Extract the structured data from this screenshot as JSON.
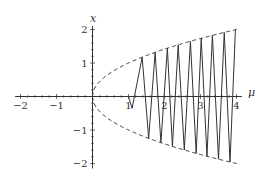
{
  "chart_data": {
    "type": "line",
    "title": "",
    "xlabel": "μ",
    "ylabel": "x",
    "xlim": [
      -2,
      4.15
    ],
    "ylim": [
      -2.15,
      2.2
    ],
    "grid": false,
    "legend": null,
    "x_ticks": [
      -2,
      -1,
      1,
      2,
      3,
      4
    ],
    "x_tick_labels": [
      "−2",
      "−1",
      "1",
      "2",
      "3",
      "4"
    ],
    "y_ticks": [
      -2,
      -1,
      1,
      2
    ],
    "y_tick_labels": [
      "−2",
      "−1",
      "1",
      "2"
    ],
    "series": [
      {
        "name": "upper envelope",
        "style": "dashed",
        "formula": "x = sqrt(μ)",
        "x": [
          0,
          0.25,
          0.5,
          1,
          1.5,
          2,
          2.5,
          3,
          3.5,
          4
        ],
        "values": [
          0,
          0.5,
          0.71,
          1,
          1.22,
          1.41,
          1.58,
          1.73,
          1.87,
          2
        ]
      },
      {
        "name": "lower envelope",
        "style": "dashed",
        "formula": "x = -sqrt(μ)",
        "x": [
          0,
          0.25,
          0.5,
          1,
          1.5,
          2,
          2.5,
          3,
          3.5,
          4
        ],
        "values": [
          0,
          -0.5,
          -0.71,
          -1,
          -1.22,
          -1.41,
          -1.58,
          -1.73,
          -1.87,
          -2
        ]
      },
      {
        "name": "trajectory",
        "style": "solid",
        "description": "oscillation between ±sqrt(μ), starting near μ≈1.1, 9 peaks up to μ=4",
        "peaks_mu": [
          1.38,
          1.74,
          2.08,
          2.38,
          2.72,
          3.02,
          3.33,
          3.66,
          3.97
        ],
        "troughs_mu": [
          1.1,
          1.56,
          1.9,
          2.22,
          2.55,
          2.88,
          3.18,
          3.5,
          3.82
        ]
      }
    ]
  },
  "labels": {
    "x_axis": "μ",
    "y_axis": "x"
  }
}
